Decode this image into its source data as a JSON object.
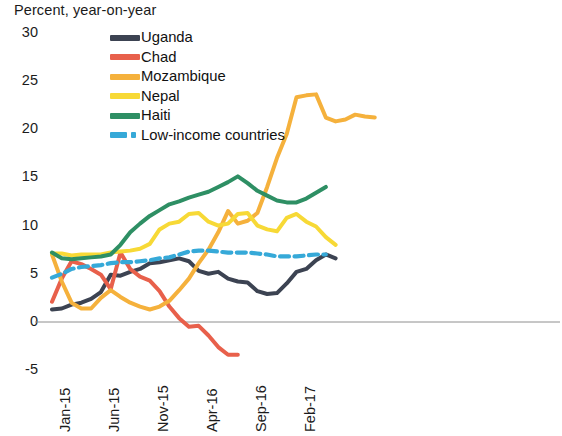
{
  "chart_data": {
    "type": "line",
    "title": "Percent, year-on-year",
    "xlabel": "",
    "ylabel": "Percent, year-on-year",
    "ylim": [
      -5,
      30
    ],
    "yticks": [
      30,
      25,
      20,
      15,
      10,
      5,
      0,
      -5
    ],
    "ytick_labels": [
      "30",
      "25",
      "20",
      "15",
      "10",
      "5",
      "0",
      "-5"
    ],
    "xticks": [
      0,
      5,
      10,
      15,
      20,
      25
    ],
    "xtick_labels": [
      "Jan-15",
      "Jun-15",
      "Nov-15",
      "Apr-16",
      "Sep-16",
      "Feb-17"
    ],
    "x_unit": "month",
    "x_start": "Jan-15",
    "x_count": 27,
    "grid": false,
    "zero_line": true,
    "legend_position": "upper-center",
    "legend": [
      "Uganda",
      "Chad",
      "Mozambique",
      "Nepal",
      "Haiti",
      "Low-income countries"
    ],
    "series": [
      {
        "name": "Uganda",
        "color": "#3c4352",
        "style": "solid",
        "values": [
          1.3,
          1.4,
          1.8,
          2.0,
          2.4,
          3.1,
          4.9,
          4.8,
          5.2,
          5.5,
          6.1,
          6.2,
          6.4,
          6.6,
          6.3,
          5.3,
          5.0,
          5.2,
          4.5,
          4.2,
          4.1,
          3.2,
          2.9,
          3.0,
          4.0,
          5.2,
          5.5,
          6.4,
          7.0,
          6.6
        ]
      },
      {
        "name": "Chad",
        "color": "#e8604b",
        "style": "solid",
        "values": [
          2.1,
          4.5,
          6.3,
          6.0,
          5.5,
          4.9,
          3.4,
          7.2,
          5.5,
          4.7,
          4.3,
          3.2,
          1.6,
          0.4,
          -0.5,
          -0.4,
          -1.4,
          -2.6,
          -3.4,
          -3.4
        ]
      },
      {
        "name": "Mozambique",
        "color": "#f5b13c",
        "style": "solid",
        "values": [
          7.0,
          4.2,
          2.0,
          1.4,
          1.4,
          2.5,
          3.3,
          2.6,
          2.0,
          1.6,
          1.3,
          1.6,
          2.2,
          3.3,
          4.5,
          6.1,
          7.5,
          9.3,
          11.5,
          10.2,
          10.5,
          11.3,
          14.0,
          17.0,
          19.5,
          23.3,
          23.5,
          23.6,
          21.2,
          20.8,
          21.0,
          21.5,
          21.3,
          21.2
        ]
      },
      {
        "name": "Nepal",
        "color": "#f7d936",
        "style": "solid",
        "values": [
          7.1,
          7.1,
          6.9,
          7.0,
          7.0,
          7.0,
          7.2,
          7.3,
          7.4,
          7.6,
          8.1,
          9.6,
          10.2,
          10.4,
          11.2,
          11.3,
          10.4,
          10.0,
          10.2,
          11.2,
          11.3,
          10.0,
          9.6,
          9.4,
          10.8,
          11.2,
          10.4,
          9.9,
          8.8,
          8.0
        ]
      },
      {
        "name": "Haiti",
        "color": "#2e8f64",
        "style": "solid",
        "values": [
          7.2,
          6.6,
          6.5,
          6.6,
          6.7,
          6.8,
          7.0,
          8.0,
          9.3,
          10.2,
          11.0,
          11.6,
          12.2,
          12.5,
          12.9,
          13.2,
          13.5,
          14.0,
          14.5,
          15.1,
          14.4,
          13.6,
          13.1,
          12.6,
          12.4,
          12.4,
          12.8,
          13.4,
          14.0
        ]
      },
      {
        "name": "Low-income countries",
        "color": "#36a9d8",
        "style": "dashed",
        "values": [
          4.6,
          5.0,
          5.5,
          5.7,
          5.8,
          5.9,
          6.1,
          6.2,
          6.2,
          6.3,
          6.4,
          6.6,
          6.7,
          7.0,
          7.3,
          7.4,
          7.4,
          7.3,
          7.2,
          7.2,
          7.2,
          7.1,
          7.0,
          6.8,
          6.8,
          6.8,
          6.9,
          7.0,
          7.0
        ]
      }
    ]
  }
}
